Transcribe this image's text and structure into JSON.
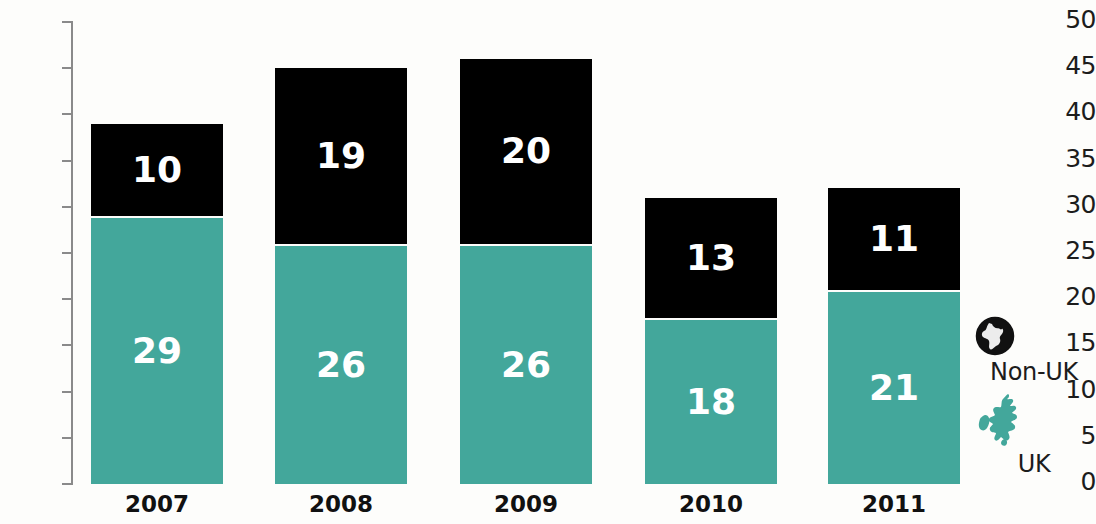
{
  "chart_data": {
    "type": "bar",
    "subtype": "stacked-bar",
    "title": "",
    "xlabel": "",
    "ylabel": "",
    "categories": [
      "2007",
      "2008",
      "2009",
      "2010",
      "2011"
    ],
    "series": [
      {
        "name": "UK",
        "color": "#43a79b",
        "values": [
          29,
          26,
          26,
          18,
          21
        ]
      },
      {
        "name": "Non-UK",
        "color": "#000000",
        "values": [
          10,
          19,
          20,
          13,
          11
        ]
      }
    ],
    "totals": [
      39,
      45,
      46,
      31,
      32
    ],
    "ylim": [
      0,
      50
    ],
    "yticks": [
      0,
      5,
      10,
      15,
      20,
      25,
      30,
      35,
      40,
      45,
      50
    ],
    "ytick_labels": [
      "0",
      "5",
      "10",
      "15",
      "20",
      "25",
      "30",
      "35",
      "40",
      "45",
      "50"
    ],
    "grid": false,
    "legend_position": "right",
    "stack_order": [
      "UK",
      "Non-UK"
    ],
    "bar_labels": {
      "2007": {
        "uk": "29",
        "nonuk": "10"
      },
      "2008": {
        "uk": "26",
        "nonuk": "19"
      },
      "2009": {
        "uk": "26",
        "nonuk": "20"
      },
      "2010": {
        "uk": "18",
        "nonuk": "13"
      },
      "2011": {
        "uk": "21",
        "nonuk": "11"
      }
    }
  },
  "legend": {
    "items": [
      {
        "label": "Non-UK",
        "icon": "globe-icon",
        "color": "#000000"
      },
      {
        "label": "UK",
        "icon": "uk-map-icon",
        "color": "#43a79b"
      }
    ]
  },
  "colors": {
    "uk": "#43a79b",
    "nonuk": "#000000",
    "background": "#fdfdfb",
    "axis": "#8a8a8a",
    "text": "#1c1c1c",
    "label_text": "#ffffff"
  }
}
